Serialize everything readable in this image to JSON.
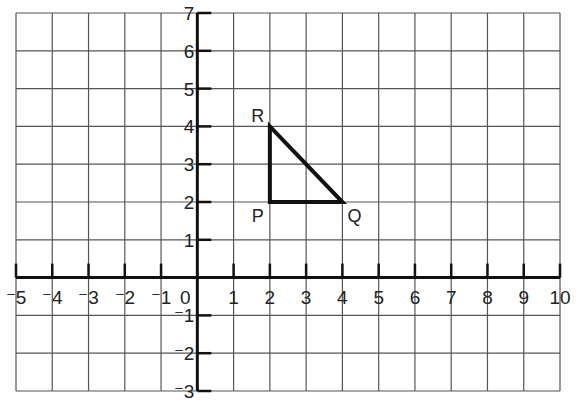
{
  "diagram": {
    "type": "coordinate-grid",
    "x_range": [
      -5,
      10
    ],
    "y_range": [
      -3,
      7
    ],
    "x_tick_labels": [
      "-5",
      "-4",
      "-3",
      "-2",
      "-1",
      "0",
      "1",
      "2",
      "3",
      "4",
      "5",
      "6",
      "7",
      "8",
      "9",
      "10"
    ],
    "y_tick_labels": [
      "7",
      "6",
      "5",
      "4",
      "3",
      "2",
      "1",
      "-1",
      "-2",
      "-3"
    ],
    "shape": {
      "name": "triangle PQR",
      "vertices": [
        {
          "label": "P",
          "x": 2,
          "y": 2
        },
        {
          "label": "Q",
          "x": 4,
          "y": 2
        },
        {
          "label": "R",
          "x": 2,
          "y": 4
        }
      ]
    },
    "colors": {
      "grid": "#555555",
      "axis": "#111111",
      "shape": "#111111",
      "text": "#222222"
    }
  }
}
